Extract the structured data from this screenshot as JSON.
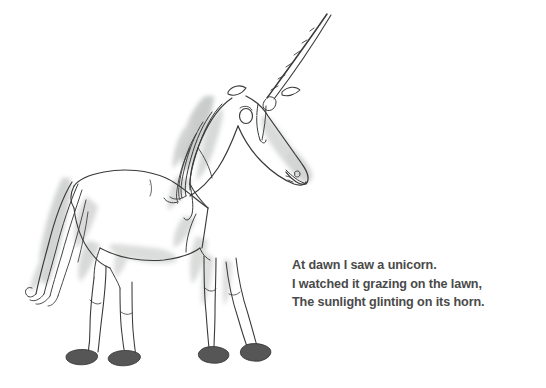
{
  "page": {
    "background_color": "#ffffff",
    "width": 546,
    "height": 388
  },
  "illustration": {
    "name": "unicorn-watercolor-sketch",
    "subject": "unicorn",
    "style": "pen-and-ink line drawing with grey watercolor wash",
    "ink_color": "#3a3a3a",
    "wash_color": "#b9bcb9",
    "hoof_color": "#565656",
    "parts": [
      "horn",
      "ears",
      "eye",
      "muzzle",
      "nostril",
      "mane",
      "neck",
      "body",
      "tail",
      "front-legs",
      "hind-legs",
      "hooves"
    ]
  },
  "poem": {
    "text_color": "#4a4a4a",
    "lines": [
      "At dawn I saw a unicorn.",
      "I watched it grazing on the lawn,",
      "The sunlight glinting on its horn."
    ]
  }
}
